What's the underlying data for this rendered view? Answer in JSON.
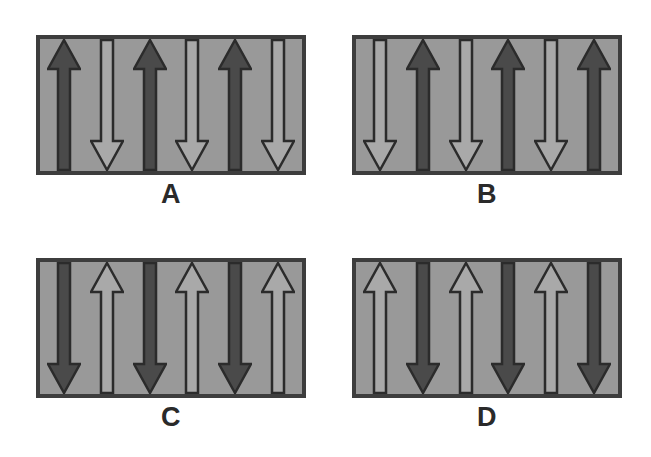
{
  "figure": {
    "background_color": "#ffffff",
    "panel_count": 4,
    "columns_per_panel": 6
  },
  "colors": {
    "panel_background": "#999999",
    "panel_border": "#3d3d3d",
    "dark_arrow_fill": "#4a4a4a",
    "dark_arrow_outline": "#2b2b2b",
    "light_arrow_fill": "#a9a9a9",
    "light_arrow_outline": "#2b2b2b",
    "label_color": "#2a2a2a"
  },
  "panels": [
    {
      "id": "a",
      "label": "A",
      "first_arrow": "dark-up",
      "arrows": [
        {
          "index": 0,
          "direction": "up",
          "shade": "dark",
          "name": "dark-up-arrow"
        },
        {
          "index": 1,
          "direction": "down",
          "shade": "light",
          "name": "light-down-arrow"
        },
        {
          "index": 2,
          "direction": "up",
          "shade": "dark",
          "name": "dark-up-arrow"
        },
        {
          "index": 3,
          "direction": "down",
          "shade": "light",
          "name": "light-down-arrow"
        },
        {
          "index": 4,
          "direction": "up",
          "shade": "dark",
          "name": "dark-up-arrow"
        },
        {
          "index": 5,
          "direction": "down",
          "shade": "light",
          "name": "light-down-arrow"
        }
      ]
    },
    {
      "id": "b",
      "label": "B",
      "first_arrow": "light-down",
      "arrows": [
        {
          "index": 0,
          "direction": "down",
          "shade": "light",
          "name": "light-down-arrow"
        },
        {
          "index": 1,
          "direction": "up",
          "shade": "dark",
          "name": "dark-up-arrow"
        },
        {
          "index": 2,
          "direction": "down",
          "shade": "light",
          "name": "light-down-arrow"
        },
        {
          "index": 3,
          "direction": "up",
          "shade": "dark",
          "name": "dark-up-arrow"
        },
        {
          "index": 4,
          "direction": "down",
          "shade": "light",
          "name": "light-down-arrow"
        },
        {
          "index": 5,
          "direction": "up",
          "shade": "dark",
          "name": "dark-up-arrow"
        }
      ]
    },
    {
      "id": "c",
      "label": "C",
      "first_arrow": "dark-down",
      "arrows": [
        {
          "index": 0,
          "direction": "down",
          "shade": "dark",
          "name": "dark-down-arrow"
        },
        {
          "index": 1,
          "direction": "up",
          "shade": "light",
          "name": "light-up-arrow"
        },
        {
          "index": 2,
          "direction": "down",
          "shade": "dark",
          "name": "dark-down-arrow"
        },
        {
          "index": 3,
          "direction": "up",
          "shade": "light",
          "name": "light-up-arrow"
        },
        {
          "index": 4,
          "direction": "down",
          "shade": "dark",
          "name": "dark-down-arrow"
        },
        {
          "index": 5,
          "direction": "up",
          "shade": "light",
          "name": "light-up-arrow"
        }
      ]
    },
    {
      "id": "d",
      "label": "D",
      "first_arrow": "light-up",
      "arrows": [
        {
          "index": 0,
          "direction": "up",
          "shade": "light",
          "name": "light-up-arrow"
        },
        {
          "index": 1,
          "direction": "down",
          "shade": "dark",
          "name": "dark-down-arrow"
        },
        {
          "index": 2,
          "direction": "up",
          "shade": "light",
          "name": "light-up-arrow"
        },
        {
          "index": 3,
          "direction": "down",
          "shade": "dark",
          "name": "dark-down-arrow"
        },
        {
          "index": 4,
          "direction": "up",
          "shade": "light",
          "name": "light-up-arrow"
        },
        {
          "index": 5,
          "direction": "down",
          "shade": "dark",
          "name": "dark-down-arrow"
        }
      ]
    }
  ]
}
